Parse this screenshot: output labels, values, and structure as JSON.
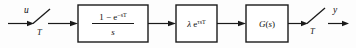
{
  "diagram": {
    "type": "block-diagram",
    "input_signal": {
      "label": "u",
      "sampler_label": "T",
      "sampler_name": "input-sampler-switch"
    },
    "output_signal": {
      "label": "y",
      "sampler_label": "T",
      "sampler_name": "output-sampler-switch"
    },
    "blocks": [
      {
        "id": "zero-order-hold",
        "numerator_prefix": "1 − e",
        "numerator_exponent": "−sT",
        "denominator": "s",
        "form": "fraction"
      },
      {
        "id": "delay-gain",
        "gain": "λ",
        "base": "e",
        "exponent": "τsT",
        "form": "inline"
      },
      {
        "id": "plant",
        "text": "G(s)",
        "text_main": "G",
        "text_paren_open": "(",
        "text_var": "s",
        "text_paren_close": ")",
        "form": "inline"
      }
    ],
    "colors": {
      "line": "#1a1a1a",
      "block_fill": "#ffffff",
      "background": "#fdfdfd",
      "text": "#111111"
    }
  }
}
